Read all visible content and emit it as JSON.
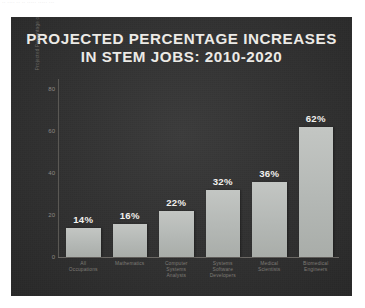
{
  "top_strip": {
    "ghost_text": "·· ···· ·· ·· ····· ····· ···"
  },
  "poster": {
    "title_line1": "PROJECTED PERCENTAGE INCREASES",
    "title_line2": "IN STEM JOBS: 2010-2020",
    "background_color": "#2f2f2f",
    "title_color": "#eceae6",
    "bar_color": "#b4b8b5",
    "axis_color": "#6b6864",
    "tick_label_color": "#8d8a85",
    "category_label_color": "#7f7c77"
  },
  "chart_data": {
    "type": "bar",
    "title": "PROJECTED PERCENTAGE INCREASES IN STEM JOBS: 2010-2020",
    "xlabel": "",
    "ylabel": "Projected Percentage of Increase 2010-20",
    "ylim": [
      0,
      85
    ],
    "yticks": [
      80,
      60,
      40,
      20,
      0
    ],
    "ytick_labels": [
      "80",
      "60",
      "40",
      "20",
      "0"
    ],
    "grid": false,
    "legend": "none",
    "categories": [
      "All Occupations",
      "Mathematics",
      "Computer Systems Analysts",
      "Systems Software Developers",
      "Medical Scientists",
      "Biomedical Engineers"
    ],
    "category_lines": [
      [
        "All",
        "Occupations"
      ],
      [
        "Mathematics"
      ],
      [
        "Computer",
        "Systems",
        "Analysts"
      ],
      [
        "Systems",
        "Software",
        "Developers"
      ],
      [
        "Medical",
        "Scientists"
      ],
      [
        "Biomedical",
        "Engineers"
      ]
    ],
    "values": [
      14,
      16,
      22,
      32,
      36,
      62
    ],
    "data_labels": [
      "14%",
      "16%",
      "22%",
      "32%",
      "36%",
      "62%"
    ]
  }
}
